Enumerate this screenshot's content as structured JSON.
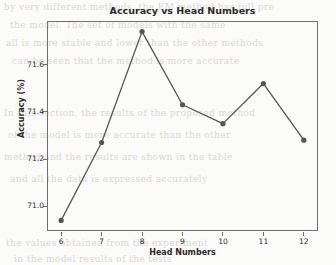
{
  "chart_data": {
    "type": "line",
    "title": "Accuracy vs Head Numbers",
    "xlabel": "Head Numbers",
    "ylabel": "Accuracy (%)",
    "x": [
      6,
      7,
      8,
      9,
      10,
      11,
      12
    ],
    "values": [
      70.94,
      71.27,
      71.74,
      71.43,
      71.35,
      71.52,
      71.28
    ],
    "series": [
      {
        "name": "Accuracy",
        "values": [
          70.94,
          71.27,
          71.74,
          71.43,
          71.35,
          71.52,
          71.28
        ]
      }
    ],
    "xtick_labels": [
      "6",
      "7",
      "8",
      "9",
      "10",
      "11",
      "12"
    ],
    "ytick_labels": [
      "71.0",
      "71.2",
      "71.4",
      "71.6"
    ],
    "ytick_values": [
      71.0,
      71.2,
      71.4,
      71.6
    ],
    "xlim": [
      5.65,
      12.35
    ],
    "ylim": [
      70.895,
      71.785
    ],
    "grid": false,
    "legend": false,
    "marker": "circle",
    "line_color": "#555555",
    "marker_color": "#555555",
    "axes_color": "#6f6f6f",
    "background_color": "#fbfbfa"
  },
  "background_text": {
    "line1": "by very different methods, the EM method has full pre",
    "line2": "the model. The set of models with the same",
    "line3": "all is more stable and lower than the other methods",
    "line4": "can be seen that the method is more accurate",
    "line5": "In this section, the results of the proposed method",
    "line6": "of the model is more accurate than the other",
    "line7": "method and the results are shown in the table",
    "line8": "and all the data is expressed accurately",
    "line9": "the values obtained from the experiment",
    "line10": "in the model results of the tests"
  }
}
